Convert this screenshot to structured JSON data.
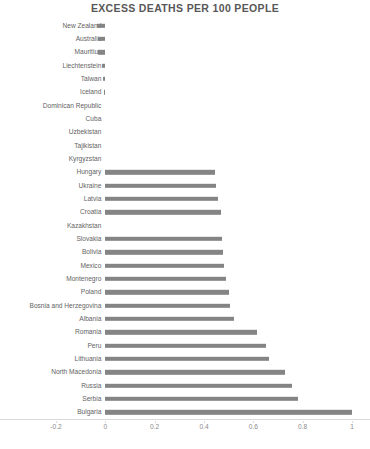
{
  "chart_data": {
    "type": "bar",
    "orientation": "horizontal",
    "title": "EXCESS DEATHS PER 100 PEOPLE",
    "xlabel": "",
    "ylabel": "",
    "xlim": [
      -0.2,
      1.0
    ],
    "xticks": [
      -0.2,
      0,
      0.2,
      0.4,
      0.6,
      0.8,
      1
    ],
    "xtick_labels": [
      "-0.2",
      "0",
      "0.2",
      "0.4",
      "0.6",
      "0.8",
      "1"
    ],
    "grid": false,
    "legend": false,
    "bar_color": "#848484",
    "categories": [
      "New Zealand",
      "Australia",
      "Mauritius",
      "Liechtenstein",
      "Taiwan",
      "Iceland",
      "Dominican Republic",
      "Cuba",
      "Uzbekistan",
      "Tajikistan",
      "Kyrgyzstan",
      "Hungary",
      "Ukraine",
      "Latvia",
      "Croatia",
      "Kazakhstan",
      "Slovakia",
      "Bolivia",
      "Mexico",
      "Montenegro",
      "Poland",
      "Bosnia and Herzegovina",
      "Albania",
      "Romania",
      "Peru",
      "Lithuania",
      "North Macedonia",
      "Russia",
      "Serbia",
      "Bulgaria"
    ],
    "values": [
      -0.035,
      -0.03,
      -0.028,
      -0.012,
      -0.011,
      -0.006,
      0,
      0,
      0,
      0,
      0,
      0.445,
      0.45,
      0.455,
      0.47,
      0,
      0.475,
      0.478,
      0.48,
      0.49,
      0.5,
      0.505,
      0.52,
      0.615,
      0.65,
      0.665,
      0.73,
      0.755,
      0.78,
      1.0
    ]
  }
}
